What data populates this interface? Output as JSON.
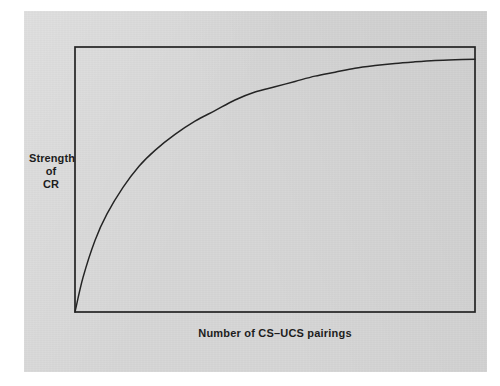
{
  "figure": {
    "panel_bg_color": "#d6d6d6",
    "page_bg_color": "#ffffff",
    "ink_color": "#242424"
  },
  "axes": {
    "y_label_line_1": "Strength",
    "y_label_line_2": "of",
    "y_label_line_3": "CR",
    "x_label": "Number of CS–UCS pairings"
  },
  "chart_data": {
    "type": "line",
    "title": "",
    "subtitle": "",
    "xlabel": "Number of CS–UCS pairings",
    "ylabel": "Strength of CR",
    "grid": false,
    "legend": null,
    "axis_ticks": {
      "x": [],
      "y": []
    },
    "xlim": [
      0,
      100
    ],
    "ylim": [
      0,
      100
    ],
    "annotations": [],
    "series": [
      {
        "name": "Acquisition of conditioned response",
        "shape": "negatively accelerated asymptotic growth",
        "x": [
          0,
          2,
          5,
          8,
          12,
          16,
          20,
          25,
          30,
          35,
          40,
          45,
          50,
          55,
          60,
          65,
          70,
          75,
          80,
          85,
          90,
          95,
          100
        ],
        "y": [
          0,
          13,
          27,
          37,
          47,
          55,
          61,
          67,
          72,
          76,
          80,
          83,
          85,
          87,
          89,
          90.5,
          92,
          93,
          93.8,
          94.4,
          94.9,
          95.2,
          95.4
        ]
      }
    ]
  }
}
